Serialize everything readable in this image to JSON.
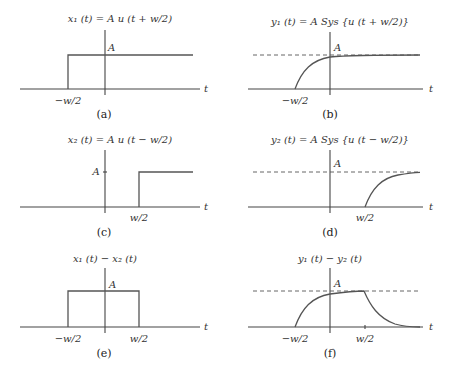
{
  "panels": {
    "a": {
      "title": "x₁ (t) = A u (t + w/2)",
      "caption": "(a)",
      "amp_label": "A",
      "tick1": "−w/2",
      "axis_label": "t"
    },
    "b": {
      "title": "y₁ (t) = A Sys {u (t + w/2)}",
      "caption": "(b)",
      "amp_label": "A",
      "tick1": "−w/2",
      "axis_label": "t"
    },
    "c": {
      "title": "x₂ (t) = A u (t − w/2)",
      "caption": "(c)",
      "amp_label": "A",
      "tick1": "w/2",
      "axis_label": "t"
    },
    "d": {
      "title": "y₂ (t) = A Sys {u (t − w/2)}",
      "caption": "(d)",
      "amp_label": "A",
      "tick1": "w/2",
      "axis_label": "t"
    },
    "e": {
      "title": "x₁ (t) − x₂ (t)",
      "caption": "(e)",
      "amp_label": "A",
      "tick1": "−w/2",
      "tick2": "w/2",
      "axis_label": "t"
    },
    "f": {
      "title": "y₁ (t) − y₂ (t)",
      "caption": "(f)",
      "amp_label": "A",
      "tick1": "−w/2",
      "tick2": "w/2",
      "axis_label": "t"
    }
  },
  "colors": {
    "axis": "#444444",
    "signal": "#555555",
    "text": "#333333"
  }
}
